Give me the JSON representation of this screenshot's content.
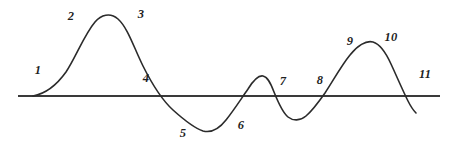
{
  "figure": {
    "background_color": "#ffffff",
    "curve_color": "#2b2b2b",
    "axis_color": "#3a3a3a",
    "label_color": "#1f1f1f"
  },
  "labels": [
    {
      "id": "label-1",
      "text": "1",
      "x": 38,
      "y": 70
    },
    {
      "id": "label-2",
      "text": "2",
      "x": 71,
      "y": 16
    },
    {
      "id": "label-3",
      "text": "3",
      "x": 141,
      "y": 14
    },
    {
      "id": "label-4",
      "text": "4",
      "x": 146,
      "y": 78
    },
    {
      "id": "label-5",
      "text": "5",
      "x": 183,
      "y": 133
    },
    {
      "id": "label-6",
      "text": "6",
      "x": 241,
      "y": 125
    },
    {
      "id": "label-7",
      "text": "7",
      "x": 283,
      "y": 81
    },
    {
      "id": "label-8",
      "text": "8",
      "x": 320,
      "y": 80
    },
    {
      "id": "label-9",
      "text": "9",
      "x": 350,
      "y": 41
    },
    {
      "id": "label-10",
      "text": "10",
      "x": 391,
      "y": 37
    },
    {
      "id": "label-11",
      "text": "11",
      "x": 425,
      "y": 74
    }
  ],
  "chart_data": {
    "type": "line",
    "title": "",
    "xlabel": "",
    "ylabel": "",
    "grid": false,
    "legend": "none",
    "axis": {
      "baseline_y": 96,
      "baseline_x_start": 18,
      "baseline_x_end": 440
    },
    "xlim": [
      0,
      452
    ],
    "ylim": [
      148,
      0
    ],
    "annotations": [
      "1",
      "2",
      "3",
      "4",
      "5",
      "6",
      "7",
      "8",
      "9",
      "10",
      "11"
    ],
    "features": [
      {
        "name": "curve-start",
        "x": 33,
        "y": 96,
        "kind": "endpoint"
      },
      {
        "name": "peak-1",
        "x": 105,
        "y": 14,
        "kind": "maximum"
      },
      {
        "name": "zero-crossing-1",
        "x": 173,
        "y": 96,
        "kind": "crossing"
      },
      {
        "name": "trough-1",
        "x": 205,
        "y": 133,
        "kind": "minimum"
      },
      {
        "name": "zero-crossing-2",
        "x": 240,
        "y": 96,
        "kind": "crossing"
      },
      {
        "name": "peak-2",
        "x": 262,
        "y": 75,
        "kind": "maximum"
      },
      {
        "name": "zero-crossing-3",
        "x": 277,
        "y": 96,
        "kind": "crossing"
      },
      {
        "name": "trough-2",
        "x": 297,
        "y": 120,
        "kind": "minimum"
      },
      {
        "name": "zero-crossing-4",
        "x": 322,
        "y": 96,
        "kind": "crossing"
      },
      {
        "name": "peak-3",
        "x": 372,
        "y": 41,
        "kind": "maximum"
      },
      {
        "name": "zero-crossing-5",
        "x": 410,
        "y": 96,
        "kind": "crossing"
      },
      {
        "name": "curve-end",
        "x": 416,
        "y": 113,
        "kind": "endpoint"
      }
    ],
    "path_d": "M 33 96 C 44 94 56 86 66 72 C 76 57 84 35 95 22 C 101 15 110 12 118 19 C 128 28 134 48 143 66 C 152 84 162 100 173 110 C 183 119 194 128 203 131 C 211 133 219 129 226 120 C 234 110 241 99 248 89 C 253 81 258 75 263 76 C 268 77 271 84 274 92 C 278 102 282 112 288 117 C 293 121 300 121 306 116 C 313 110 318 103 325 93 C 333 81 341 66 350 55 C 357 46 366 40 373 42 C 380 44 386 53 391 64 C 397 77 403 91 408 101 C 411 107 414 111 416 113"
  }
}
